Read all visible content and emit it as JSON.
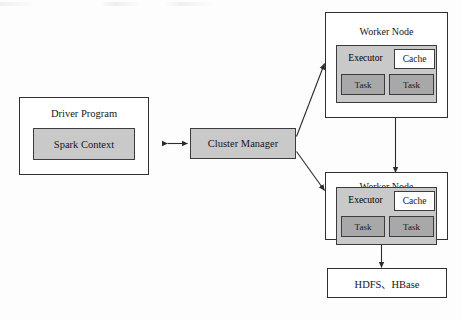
{
  "diagram": {
    "background_color": "#fdfdfd",
    "line_color": "#2f2f33",
    "fill_gray": "#c9c9c9",
    "fill_dark_gray": "#a8a8a8",
    "fill_white": "#ffffff",
    "driver": {
      "label": "Driver Program",
      "spark_context_label": "Spark Context"
    },
    "cluster_manager": {
      "label": "Cluster Manager"
    },
    "workers": [
      {
        "label": "Worker Node",
        "executor_label": "Executor",
        "cache_label": "Cache",
        "tasks": [
          "Task",
          "Task"
        ]
      },
      {
        "label": "Worker Node",
        "executor_label": "Executor",
        "cache_label": "Cache",
        "tasks": [
          "Task",
          "Task"
        ]
      }
    ],
    "storage": {
      "label": "HDFS、HBase"
    },
    "connections": [
      {
        "name": "driver-cluster-manager",
        "style": "bidirectional-horizontal"
      },
      {
        "name": "cluster-manager-worker-top",
        "style": "bidirectional-diagonal"
      },
      {
        "name": "cluster-manager-worker-bottom",
        "style": "bidirectional-diagonal"
      },
      {
        "name": "worker-top-worker-bottom",
        "style": "bidirectional-vertical"
      },
      {
        "name": "worker-bottom-storage",
        "style": "bidirectional-vertical"
      }
    ]
  }
}
